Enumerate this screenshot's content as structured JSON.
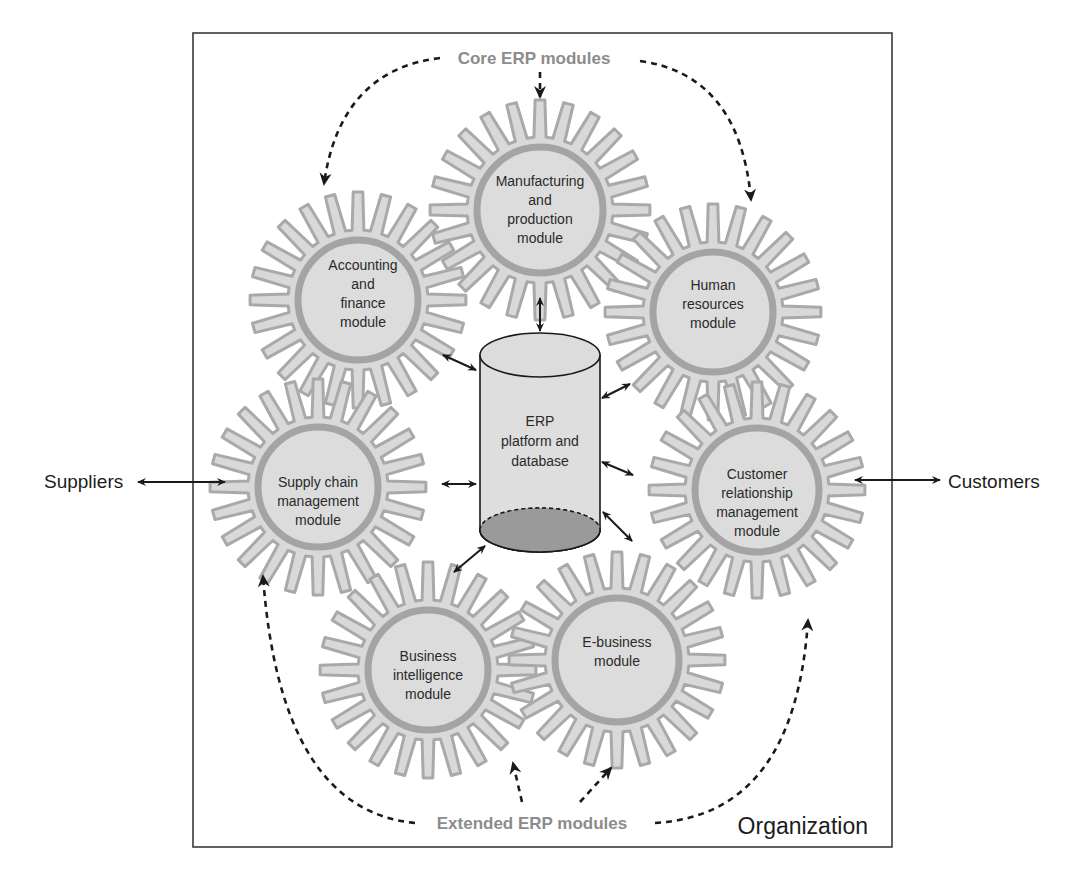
{
  "diagram": {
    "title_top": "Core ERP modules",
    "title_bottom": "Extended ERP modules",
    "boundary_label": "Organization",
    "external_left": "Suppliers",
    "external_right": "Customers",
    "database": {
      "lines": [
        "ERP",
        "platform and",
        "database"
      ]
    },
    "modules": [
      {
        "id": "manufacturing",
        "category": "core",
        "lines": [
          "Manufacturing",
          "and",
          "production",
          "module"
        ]
      },
      {
        "id": "accounting",
        "category": "core",
        "lines": [
          "Accounting",
          "and",
          "finance",
          "module"
        ]
      },
      {
        "id": "human-resources",
        "category": "core",
        "lines": [
          "Human",
          "resources",
          "module"
        ]
      },
      {
        "id": "supply-chain",
        "category": "extended",
        "lines": [
          "Supply chain",
          "management",
          "module"
        ]
      },
      {
        "id": "crm",
        "category": "extended",
        "lines": [
          "Customer",
          "relationship",
          "management",
          "module"
        ]
      },
      {
        "id": "business-intelligence",
        "category": "extended",
        "lines": [
          "Business",
          "intelligence",
          "module"
        ]
      },
      {
        "id": "e-business",
        "category": "extended",
        "lines": [
          "E-business",
          "module"
        ]
      }
    ],
    "colors": {
      "gear_fill": "#d9d9d9",
      "gear_stroke": "#a9a9a9",
      "category_label": "#8c8c8c",
      "db_bottom": "#9a9a9a",
      "db_body": "#dedede",
      "line": "#1a1a1a"
    }
  }
}
